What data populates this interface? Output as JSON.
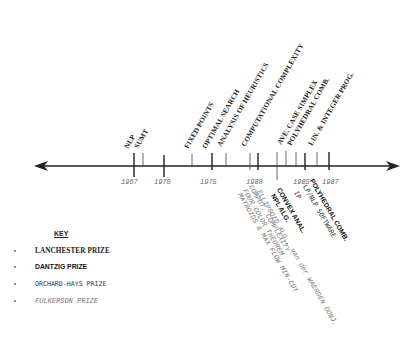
{
  "timeline": {
    "years": [
      {
        "label": "1967",
        "x": 136
      },
      {
        "label": "1970",
        "x": 166
      },
      {
        "label": "1975",
        "x": 212
      },
      {
        "label": "1980",
        "x": 251
      },
      {
        "label": "1985",
        "x": 304
      },
      {
        "label": "1987",
        "x": 329
      }
    ],
    "above": [
      {
        "text": "NLP",
        "x": 134,
        "style": "lanch"
      },
      {
        "text": "SUMT",
        "x": 143,
        "style": "lanch"
      },
      {
        "text": "FIXED POINTS",
        "x": 192,
        "style": "lanch"
      },
      {
        "text": "OPTIMAL SEARCH",
        "x": 212,
        "style": "lanch"
      },
      {
        "text": "ANALYSIS OF HEURISTICS",
        "x": 226,
        "style": "lanch"
      },
      {
        "text": "COMPUTATIONAL COMPLEXITY",
        "x": 250,
        "style": "lanch"
      },
      {
        "text": "AVE. CASE SIMPLEX",
        "x": 286,
        "style": "lanch"
      },
      {
        "text": "POLYHEDRAL COMB.",
        "x": 296,
        "style": "lanch"
      },
      {
        "text": "LIN. & INTEGER PROG.",
        "x": 317,
        "style": "lanch"
      }
    ],
    "below": [
      {
        "text": "MATROIDS & MAX FLOW MIN-CUT",
        "x": 240,
        "style": "fulk"
      },
      {
        "text": "FOUR COLOR THEOREM",
        "x": 245,
        "style": "fulk"
      },
      {
        "text": "COMPUT. COMPLEXITY",
        "x": 250,
        "style": "fulk"
      },
      {
        "text": "ELLIPSOID ALG., van der WAERDEN CONJ.",
        "x": 258,
        "style": "fulk"
      },
      {
        "text": "NPL ALG.",
        "x": 273,
        "style": "dantz"
      },
      {
        "text": "CONVEX ANAL.",
        "x": 279,
        "style": "dantz"
      },
      {
        "text": "IP",
        "x": 296,
        "style": "orch"
      },
      {
        "text": "LP/NLP SOFTWARE",
        "x": 304,
        "style": "orch"
      },
      {
        "text": "POLYHEDRAL COMB.",
        "x": 312,
        "style": "dantz"
      }
    ]
  },
  "key": {
    "title": "KEY",
    "items": [
      {
        "label": "LANCHESTER PRIZE",
        "style": "lanch"
      },
      {
        "label": "DANTZIG PRIZE",
        "style": "dantz"
      },
      {
        "label": "ORCHARD-HAYS PRIZE",
        "style": "orch"
      },
      {
        "label": "FULKERSON PRIZE",
        "style": "fulk"
      }
    ]
  },
  "colors": {
    "line": "#222222",
    "text": "#222222",
    "fulkerson": "#777777"
  }
}
